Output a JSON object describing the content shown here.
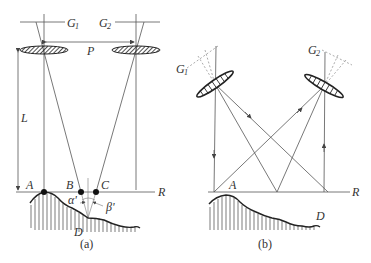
{
  "figure": {
    "panel_a": {
      "caption": "(a)",
      "labels": {
        "G1": "G",
        "G1_sub": "1",
        "G2": "G",
        "G2_sub": "2",
        "P": "P",
        "L": "L",
        "A": "A",
        "B": "B",
        "C": "C",
        "R": "R",
        "D": "D",
        "alpha": "α'",
        "beta": "β'"
      }
    },
    "panel_b": {
      "caption": "(b)",
      "labels": {
        "G1": "G",
        "G1_sub": "1",
        "G2": "G",
        "G2_sub": "2",
        "A": "A",
        "R": "R",
        "D": "D"
      }
    },
    "colors": {
      "line": "#555555",
      "ground": "#222222",
      "background": "#ffffff"
    }
  }
}
